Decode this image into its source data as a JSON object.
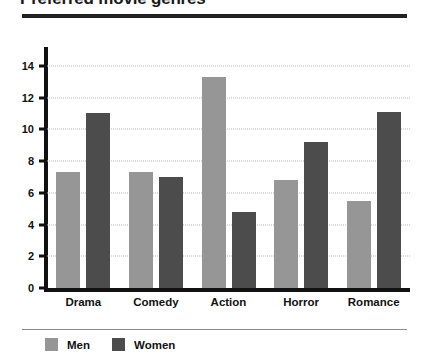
{
  "chart_data": {
    "type": "bar",
    "title": "Preferred movie genres",
    "xlabel": "",
    "ylabel": "",
    "categories": [
      "Drama",
      "Comedy",
      "Action",
      "Horror",
      "Romance"
    ],
    "series": [
      {
        "name": "Men",
        "color": "#969696",
        "values": [
          7.3,
          7.3,
          13.3,
          6.8,
          5.5
        ]
      },
      {
        "name": "Women",
        "color": "#4c4c4c",
        "values": [
          11.0,
          7.0,
          4.8,
          9.2,
          11.1
        ]
      }
    ],
    "ylim": [
      0,
      15
    ],
    "yticks": [
      0,
      2,
      4,
      6,
      8,
      10,
      12,
      14
    ],
    "ytick_labels": [
      "0",
      "2",
      "4",
      "6",
      "8",
      "10",
      "12",
      "14"
    ],
    "grid": true,
    "legend_position": "bottom-left"
  }
}
